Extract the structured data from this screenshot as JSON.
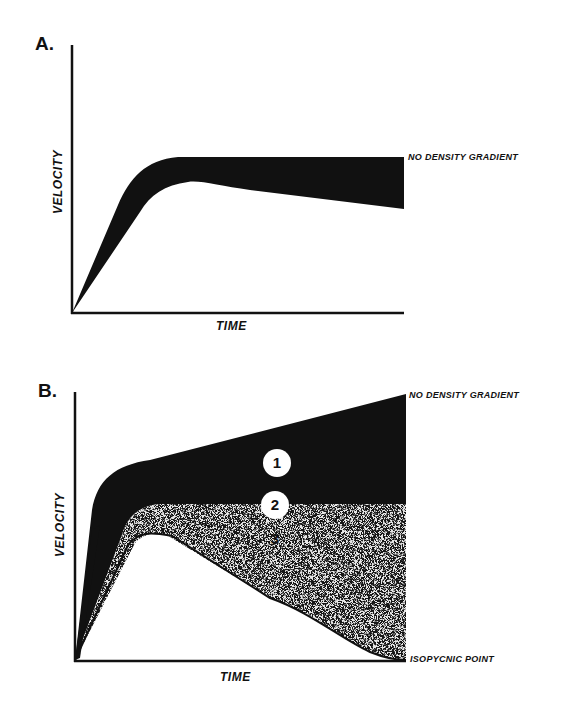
{
  "panels": [
    {
      "letter": "A.",
      "xlabel": "TIME",
      "ylabel": "VELOCITY",
      "annotations": {
        "top_right": "NO DENSITY GRADIENT"
      }
    },
    {
      "letter": "B.",
      "xlabel": "TIME",
      "ylabel": "VELOCITY",
      "annotations": {
        "top_right": "NO DENSITY GRADIENT",
        "bottom_right": "ISOPYCNIC POINT"
      },
      "regions": [
        {
          "id": "1",
          "label": "1",
          "fill": "black"
        },
        {
          "id": "2",
          "label": "2",
          "fill": "boundary"
        },
        {
          "id": "3",
          "label": "3",
          "fill": "stipple"
        }
      ]
    }
  ],
  "colors": {
    "ink": "#111111",
    "background": "#ffffff",
    "stipple": "#bdbdbd"
  }
}
